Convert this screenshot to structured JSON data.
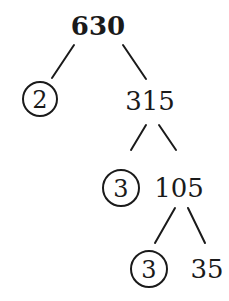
{
  "diagram": {
    "type": "factor-tree",
    "root": {
      "value": "630",
      "bold": true
    },
    "nodes": [
      {
        "id": "n630",
        "label": "630",
        "circled": false,
        "bold": true
      },
      {
        "id": "n2",
        "label": "2",
        "circled": true
      },
      {
        "id": "n315",
        "label": "315",
        "circled": false
      },
      {
        "id": "n3a",
        "label": "3",
        "circled": true
      },
      {
        "id": "n105",
        "label": "105",
        "circled": false
      },
      {
        "id": "n3b",
        "label": "3",
        "circled": true
      },
      {
        "id": "n35",
        "label": "35",
        "circled": false
      }
    ],
    "edges": [
      {
        "from": "630",
        "to": "2"
      },
      {
        "from": "630",
        "to": "315"
      },
      {
        "from": "315",
        "to": "3"
      },
      {
        "from": "315",
        "to": "105"
      },
      {
        "from": "105",
        "to": "3"
      },
      {
        "from": "105",
        "to": "35"
      }
    ],
    "colors": {
      "ink": "#1a1a1a",
      "background": "#ffffff"
    }
  }
}
